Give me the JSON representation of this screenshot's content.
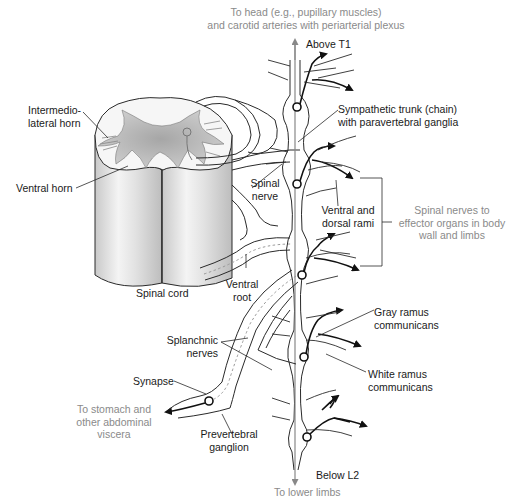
{
  "figure": {
    "type": "anatomical-diagram",
    "colors": {
      "outline": "#2a2a2a",
      "nerve_fill": "#ededed",
      "gray_matter": "#b8b8b8",
      "cord_fill": "#d9d9d9",
      "destination_text": "#8a8a8a",
      "label_text": "#1a1a1a",
      "arrow": "#111111"
    }
  },
  "labels": {
    "to_head": {
      "line1": "To head (e.g., pupillary muscles)",
      "line2": "and carotid arteries with periarterial plexus"
    },
    "above_t1": "Above T1",
    "intermediolateral_horn": {
      "line1": "Intermedio-",
      "line2": "lateral horn"
    },
    "sympathetic_trunk": {
      "line1": "Sympathetic trunk (chain)",
      "line2": "with paravertebral ganglia"
    },
    "ventral_horn": "Ventral horn",
    "spinal_nerve": {
      "line1": "Spinal",
      "line2": "nerve"
    },
    "ventral_dorsal_rami": {
      "line1": "Ventral and",
      "line2": "dorsal rami"
    },
    "spinal_nerves_effector": {
      "line1": "Spinal nerves to",
      "line2": "effector organs in body",
      "line3": "wall and limbs"
    },
    "spinal_cord": "Spinal cord",
    "ventral_root": {
      "line1": "Ventral",
      "line2": "root"
    },
    "gray_ramus": {
      "line1": "Gray ramus",
      "line2": "communicans"
    },
    "splanchnic_nerves": {
      "line1": "Splanchnic",
      "line2": "nerves"
    },
    "white_ramus": {
      "line1": "White ramus",
      "line2": "communicans"
    },
    "synapse": "Synapse",
    "to_stomach": {
      "line1": "To stomach and",
      "line2": "other abdominal",
      "line3": "viscera"
    },
    "prevertebral_ganglion": {
      "line1": "Prevertebral",
      "line2": "ganglion"
    },
    "below_l2": "Below L2",
    "to_lower_limbs": "To lower limbs"
  }
}
